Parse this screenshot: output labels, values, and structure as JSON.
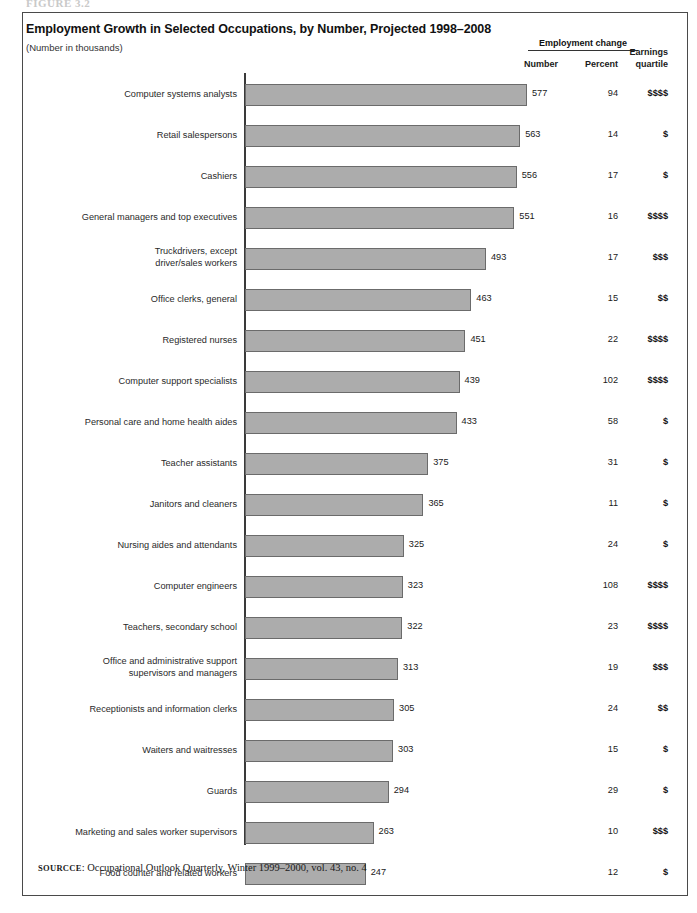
{
  "figure_caption": "FIGURE 3.2",
  "chart": {
    "title": "Employment Growth in Selected Occupations, by Number, Projected 1998–2008",
    "subtitle": "(Number in thousands)",
    "headers": {
      "group": "Employment change",
      "number": "Number",
      "percent": "Percent",
      "earnings_line1": "Earnings",
      "earnings_line2": "quartile"
    },
    "source_label": "SOURCCE",
    "source_text": ": Occupational Outlook Quarterly, Winter 1999–2000, vol. 43, no. 4",
    "bar_color": "#acacac",
    "bar_border_color": "#6b6b6b",
    "axis_color": "#3a3a3a"
  },
  "chart_data": {
    "type": "bar",
    "orientation": "horizontal",
    "title": "Employment Growth in Selected Occupations, by Number, Projected 1998–2008",
    "subtitle": "(Number in thousands)",
    "xlabel": "",
    "ylabel": "",
    "xlim": [
      0,
      600
    ],
    "grid": false,
    "legend": "none",
    "value_unit": "thousands",
    "columns": [
      "Occupation",
      "Number",
      "Percent",
      "Earnings quartile"
    ],
    "categories": [
      "Computer systems analysts",
      "Retail salespersons",
      "Cashiers",
      "General managers and top executives",
      "Truckdrivers, except driver/sales workers",
      "Office clerks, general",
      "Registered nurses",
      "Computer support specialists",
      "Personal care and home health aides",
      "Teacher assistants",
      "Janitors and cleaners",
      "Nursing aides and attendants",
      "Computer engineers",
      "Teachers, secondary school",
      "Office and administrative support supervisors and managers",
      "Receptionists and information clerks",
      "Waiters and waitresses",
      "Guards",
      "Marketing and sales worker supervisors",
      "Food counter and related workers"
    ],
    "values": [
      577,
      563,
      556,
      551,
      493,
      463,
      451,
      439,
      433,
      375,
      365,
      325,
      323,
      322,
      313,
      305,
      303,
      294,
      263,
      247
    ],
    "percent": [
      94,
      14,
      17,
      16,
      17,
      15,
      22,
      102,
      58,
      31,
      11,
      24,
      108,
      23,
      19,
      24,
      15,
      29,
      10,
      12
    ],
    "earnings_quartile": [
      "$$$$",
      "$",
      "$",
      "$$$$",
      "$$$",
      "$$",
      "$$$$",
      "$$$$",
      "$",
      "$",
      "$",
      "$",
      "$$$$",
      "$$$$",
      "$$$",
      "$$",
      "$",
      "$",
      "$$$",
      "$"
    ]
  },
  "rows": [
    {
      "label_lines": [
        "Computer systems analysts"
      ],
      "value": 577,
      "percent": 94,
      "quartile": "$$$$"
    },
    {
      "label_lines": [
        "Retail salespersons"
      ],
      "value": 563,
      "percent": 14,
      "quartile": "$"
    },
    {
      "label_lines": [
        "Cashiers"
      ],
      "value": 556,
      "percent": 17,
      "quartile": "$"
    },
    {
      "label_lines": [
        "General managers and top executives"
      ],
      "value": 551,
      "percent": 16,
      "quartile": "$$$$"
    },
    {
      "label_lines": [
        "Truckdrivers, except",
        "driver/sales workers"
      ],
      "value": 493,
      "percent": 17,
      "quartile": "$$$"
    },
    {
      "label_lines": [
        "Office clerks, general"
      ],
      "value": 463,
      "percent": 15,
      "quartile": "$$"
    },
    {
      "label_lines": [
        "Registered nurses"
      ],
      "value": 451,
      "percent": 22,
      "quartile": "$$$$"
    },
    {
      "label_lines": [
        "Computer support specialists"
      ],
      "value": 439,
      "percent": 102,
      "quartile": "$$$$"
    },
    {
      "label_lines": [
        "Personal care and home health aides"
      ],
      "value": 433,
      "percent": 58,
      "quartile": "$"
    },
    {
      "label_lines": [
        "Teacher assistants"
      ],
      "value": 375,
      "percent": 31,
      "quartile": "$"
    },
    {
      "label_lines": [
        "Janitors and cleaners"
      ],
      "value": 365,
      "percent": 11,
      "quartile": "$"
    },
    {
      "label_lines": [
        "Nursing aides and attendants"
      ],
      "value": 325,
      "percent": 24,
      "quartile": "$"
    },
    {
      "label_lines": [
        "Computer engineers"
      ],
      "value": 323,
      "percent": 108,
      "quartile": "$$$$"
    },
    {
      "label_lines": [
        "Teachers, secondary school"
      ],
      "value": 322,
      "percent": 23,
      "quartile": "$$$$"
    },
    {
      "label_lines": [
        "Office and administrative support",
        "supervisors and managers"
      ],
      "value": 313,
      "percent": 19,
      "quartile": "$$$"
    },
    {
      "label_lines": [
        "Receptionists and information clerks"
      ],
      "value": 305,
      "percent": 24,
      "quartile": "$$"
    },
    {
      "label_lines": [
        "Waiters and waitresses"
      ],
      "value": 303,
      "percent": 15,
      "quartile": "$"
    },
    {
      "label_lines": [
        "Guards"
      ],
      "value": 294,
      "percent": 29,
      "quartile": "$"
    },
    {
      "label_lines": [
        "Marketing and sales worker supervisors"
      ],
      "value": 263,
      "percent": 10,
      "quartile": "$$$"
    },
    {
      "label_lines": [
        "Food counter and related workers"
      ],
      "value": 247,
      "percent": 12,
      "quartile": "$"
    }
  ]
}
